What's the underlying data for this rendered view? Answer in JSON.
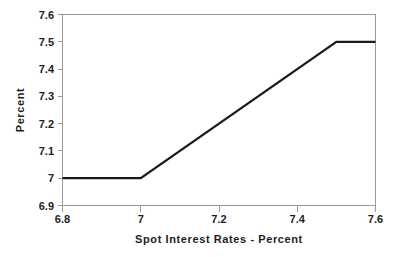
{
  "chart_data": {
    "type": "line",
    "title": "",
    "subtitle": "",
    "xlabel": "Spot Interest Rates - Percent",
    "ylabel": "Percent",
    "xlim": [
      6.8,
      7.6
    ],
    "ylim": [
      6.9,
      7.6
    ],
    "grid": false,
    "legend": null,
    "legend_position": "none",
    "x_ticks": [
      6.8,
      7,
      7.2,
      7.4,
      7.6
    ],
    "x_tick_labels": [
      "6.8",
      "7",
      "7.2",
      "7.4",
      "7.6"
    ],
    "y_ticks": [
      6.9,
      7,
      7.1,
      7.2,
      7.3,
      7.4,
      7.5,
      7.6
    ],
    "y_tick_labels": [
      "6.9",
      "7",
      "7.1",
      "7.2",
      "7.3",
      "7.4",
      "7.5",
      "7.6"
    ],
    "series": [
      {
        "name": "Capped floored rate",
        "color": "#1a1a1a",
        "x": [
          6.8,
          7.0,
          7.5,
          7.6
        ],
        "values": [
          7.0,
          7.0,
          7.5,
          7.5
        ]
      }
    ],
    "annotations": []
  },
  "axes": {
    "x_title": "Spot Interest Rates - Percent",
    "y_title": "Percent"
  }
}
